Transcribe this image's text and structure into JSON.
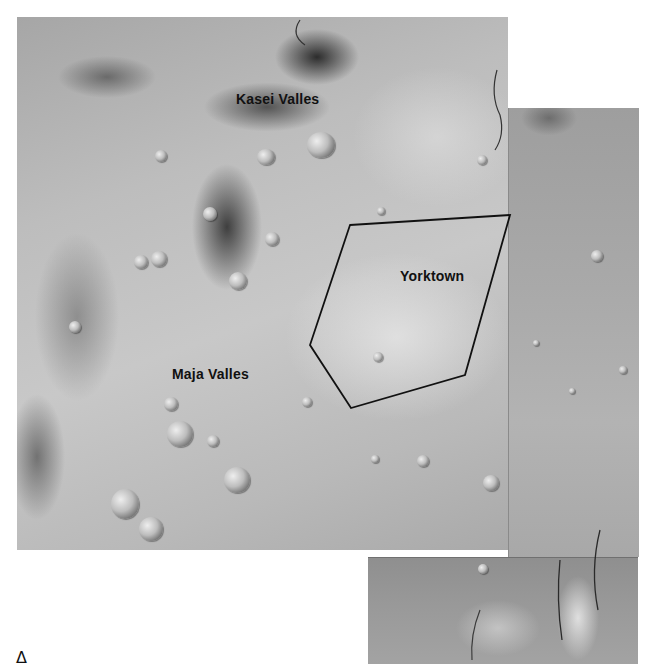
{
  "map": {
    "type": "orbital photomosaic",
    "panels": [
      {
        "id": "main",
        "x": 17,
        "y": 17,
        "width": 491,
        "height": 533
      },
      {
        "id": "right",
        "x": 508,
        "y": 108,
        "width": 130,
        "height": 449
      },
      {
        "id": "bottom",
        "x": 368,
        "y": 557,
        "width": 270,
        "height": 106
      }
    ],
    "labels": {
      "kasei": "Kasei Valles",
      "maja": "Maja Valles",
      "yorktown": "Yorktown"
    },
    "label_positions": {
      "kasei": {
        "x": 236,
        "y": 91
      },
      "maja": {
        "x": 172,
        "y": 366
      },
      "yorktown": {
        "x": 400,
        "y": 268
      }
    },
    "region_outline": {
      "name": "Yorktown",
      "stroke_color": "#111111",
      "points": [
        [
          350,
          225
        ],
        [
          510,
          215
        ],
        [
          465,
          375
        ],
        [
          351,
          408
        ],
        [
          310,
          345
        ]
      ]
    },
    "corner_mark": "Δ"
  }
}
